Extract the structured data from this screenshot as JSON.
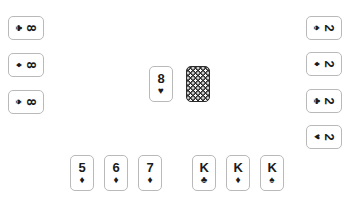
{
  "board": {
    "background_color": "#ffffff",
    "card_face_color": "#ffffff",
    "card_border_color": "#b9b9b9",
    "card_back_color": "#2b2b2b",
    "card_back_dot_color": "#ffffff",
    "text_color": "#1b1b1b"
  },
  "suits": {
    "spade": "♠",
    "heart": "♥",
    "diamond": "♦",
    "club": "♣"
  },
  "hands": {
    "left": {
      "orientation": "rotated-90",
      "cards": [
        {
          "rank": "8",
          "suit": "♣",
          "suit_name": "club",
          "label": "8 of clubs"
        },
        {
          "rank": "8",
          "suit": "♦",
          "suit_name": "diamond",
          "label": "8 of diamonds"
        },
        {
          "rank": "8",
          "suit": "♠",
          "suit_name": "spade",
          "label": "8 of spades"
        }
      ]
    },
    "right": {
      "orientation": "rotated-90",
      "cards": [
        {
          "rank": "2",
          "suit": "♠",
          "suit_name": "spade",
          "label": "2 of spades"
        },
        {
          "rank": "2",
          "suit": "♦",
          "suit_name": "diamond",
          "label": "2 of diamonds"
        },
        {
          "rank": "2",
          "suit": "♣",
          "suit_name": "club",
          "label": "2 of clubs"
        },
        {
          "rank": "2",
          "suit": "♥",
          "suit_name": "heart",
          "label": "2 of hearts"
        }
      ]
    },
    "bottom": {
      "orientation": "upright",
      "cards": [
        {
          "rank": "5",
          "suit": "♦",
          "suit_name": "diamond",
          "label": "5 of diamonds"
        },
        {
          "rank": "6",
          "suit": "♦",
          "suit_name": "diamond",
          "label": "6 of diamonds"
        },
        {
          "rank": "7",
          "suit": "♦",
          "suit_name": "diamond",
          "label": "7 of diamonds"
        },
        {
          "rank": "K",
          "suit": "♣",
          "suit_name": "club",
          "label": "King of clubs"
        },
        {
          "rank": "K",
          "suit": "♦",
          "suit_name": "diamond",
          "label": "King of diamonds"
        },
        {
          "rank": "K",
          "suit": "♠",
          "suit_name": "spade",
          "label": "King of spades"
        }
      ]
    }
  },
  "center": {
    "face_up": {
      "rank": "8",
      "suit": "♥",
      "suit_name": "heart",
      "label": "8 of hearts"
    },
    "face_down": {
      "label": "face down card"
    }
  }
}
